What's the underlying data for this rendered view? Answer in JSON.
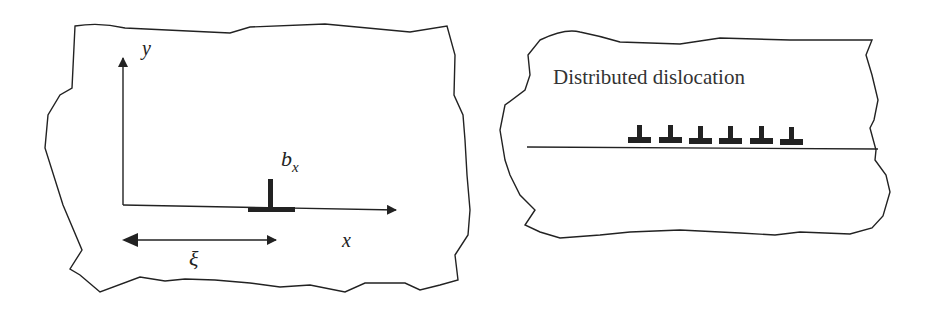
{
  "figure": {
    "left_panel": {
      "axis_y_label": "y",
      "axis_x_label": "x",
      "burgers_label_main": "b",
      "burgers_label_sub": "x",
      "distance_label": "ξ",
      "dislocation_symbol": "edge-dislocation"
    },
    "right_panel": {
      "title": "Distributed dislocation",
      "dislocation_count": 6
    },
    "colors": {
      "stroke": "#222222",
      "background": "#ffffff"
    }
  }
}
